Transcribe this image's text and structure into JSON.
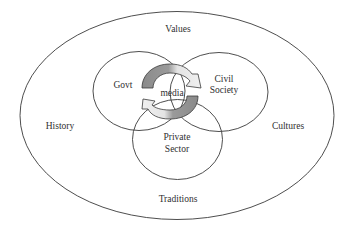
{
  "diagram": {
    "outer_context": {
      "labels": {
        "top": "Values",
        "left": "History",
        "right": "Cultures",
        "bottom": "Traditions"
      }
    },
    "sectors": {
      "govt": "Govt",
      "civil_society_line1": "Civil",
      "civil_society_line2": "Society",
      "private_sector_line1": "Private",
      "private_sector_line2": "Sector"
    },
    "center": {
      "label": "media"
    },
    "colors": {
      "outline": "#3a3a3a",
      "text": "#2f2f2f",
      "arrow_dark": "#8a8a8a",
      "arrow_light": "#ececec",
      "background": "#ffffff"
    }
  }
}
